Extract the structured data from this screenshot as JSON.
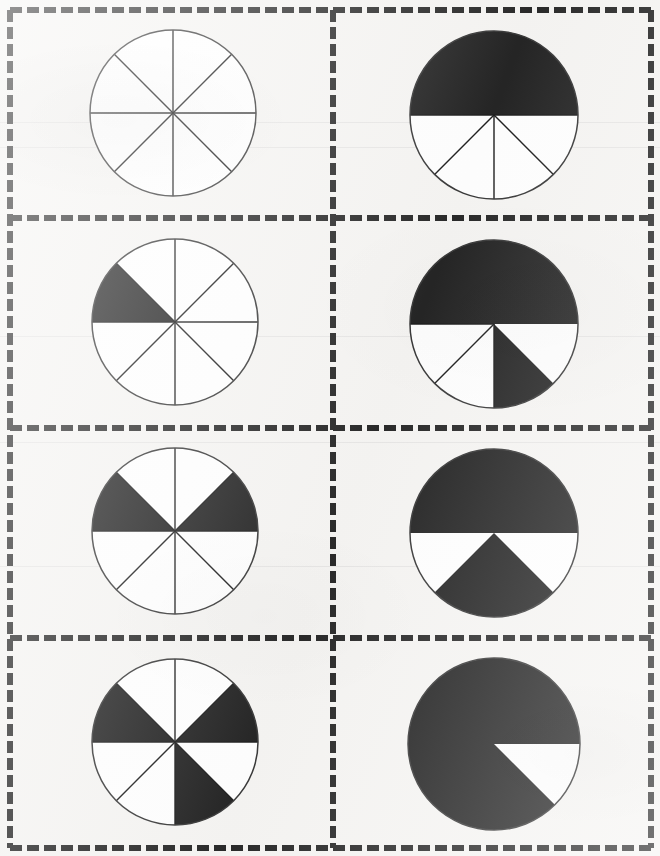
{
  "document": {
    "title": "Fraction Circles Worksheet",
    "description": "Worksheet page with eight circles each divided into eight equal sectors; a varying number of sectors is shaded black.",
    "page_background": "#f6f5f3",
    "ink_color": "#1f1f1f",
    "fill_color": "#252525",
    "border_color": "#2a2a2a",
    "outline_color": "#3a3a3a"
  },
  "grid": {
    "columns": 2,
    "rows": 4,
    "border_style": "dashed",
    "dash_length": 12,
    "dash_gap": 5,
    "border_thickness": 6,
    "outer": {
      "x": 10,
      "y": 10,
      "width": 641,
      "height": 838
    },
    "row_dividers_y": [
      218,
      428,
      638
    ],
    "column_divider_x": 333
  },
  "scanlines_y": [
    122,
    147,
    336,
    442,
    566
  ],
  "chart_data": [
    {
      "id": "circle-r1c1",
      "type": "pie",
      "title": "Circle 1",
      "row": 1,
      "column": 1,
      "total_sectors": 8,
      "filled_sectors": 0,
      "fraction": "0/8",
      "fraction_simplified": "0",
      "percent": 0,
      "filled_sector_indices": [],
      "visible_divider_indices": [
        0,
        1,
        2,
        3,
        4,
        5,
        6,
        7
      ],
      "categories": [
        "shaded",
        "unshaded"
      ],
      "values": [
        0,
        8
      ],
      "center": {
        "x": 173,
        "y": 113
      },
      "radius": 83
    },
    {
      "id": "circle-r1c2",
      "type": "pie",
      "title": "Circle 2",
      "row": 1,
      "column": 2,
      "total_sectors": 8,
      "filled_sectors": 4,
      "fraction": "4/8",
      "fraction_simplified": "1/2",
      "percent": 50,
      "filled_sector_indices": [
        0,
        1,
        2,
        3
      ],
      "visible_divider_indices": [
        4,
        5,
        6,
        7
      ],
      "categories": [
        "shaded",
        "unshaded"
      ],
      "values": [
        4,
        4
      ],
      "center": {
        "x": 494,
        "y": 115
      },
      "radius": 84
    },
    {
      "id": "circle-r2c1",
      "type": "pie",
      "title": "Circle 3",
      "row": 2,
      "column": 1,
      "total_sectors": 8,
      "filled_sectors": 1,
      "fraction": "1/8",
      "fraction_simplified": "1/8",
      "percent": 12.5,
      "filled_sector_indices": [
        3
      ],
      "visible_divider_indices": [
        0,
        1,
        2,
        3,
        4,
        5,
        6,
        7
      ],
      "categories": [
        "shaded",
        "unshaded"
      ],
      "values": [
        1,
        7
      ],
      "center": {
        "x": 175,
        "y": 322
      },
      "radius": 83
    },
    {
      "id": "circle-r2c2",
      "type": "pie",
      "title": "Circle 4",
      "row": 2,
      "column": 2,
      "total_sectors": 8,
      "filled_sectors": 5,
      "fraction": "5/8",
      "fraction_simplified": "5/8",
      "percent": 62.5,
      "filled_sector_indices": [
        0,
        1,
        2,
        3,
        6
      ],
      "visible_divider_indices": [
        4,
        5
      ],
      "categories": [
        "shaded",
        "unshaded"
      ],
      "values": [
        5,
        3
      ],
      "center": {
        "x": 494,
        "y": 324
      },
      "radius": 84
    },
    {
      "id": "circle-r3c1",
      "type": "pie",
      "title": "Circle 5",
      "row": 3,
      "column": 1,
      "total_sectors": 8,
      "filled_sectors": 2,
      "fraction": "2/8",
      "fraction_simplified": "1/4",
      "percent": 25,
      "filled_sector_indices": [
        0,
        3
      ],
      "visible_divider_indices": [
        0,
        1,
        2,
        3,
        4,
        5,
        6,
        7
      ],
      "categories": [
        "shaded",
        "unshaded"
      ],
      "values": [
        2,
        6
      ],
      "center": {
        "x": 175,
        "y": 531
      },
      "radius": 83
    },
    {
      "id": "circle-r3c2",
      "type": "pie",
      "title": "Circle 6",
      "row": 3,
      "column": 2,
      "total_sectors": 8,
      "filled_sectors": 6,
      "fraction": "6/8",
      "fraction_simplified": "3/4",
      "percent": 75,
      "filled_sector_indices": [
        0,
        1,
        2,
        3,
        5,
        6
      ],
      "visible_divider_indices": [],
      "categories": [
        "shaded",
        "unshaded"
      ],
      "values": [
        6,
        2
      ],
      "center": {
        "x": 494,
        "y": 533
      },
      "radius": 84
    },
    {
      "id": "circle-r4c1",
      "type": "pie",
      "title": "Circle 7",
      "row": 4,
      "column": 1,
      "total_sectors": 8,
      "filled_sectors": 3,
      "fraction": "3/8",
      "fraction_simplified": "3/8",
      "percent": 37.5,
      "filled_sector_indices": [
        0,
        3,
        6
      ],
      "visible_divider_indices": [
        0,
        1,
        2,
        3,
        4,
        5,
        6,
        7
      ],
      "categories": [
        "shaded",
        "unshaded"
      ],
      "values": [
        3,
        5
      ],
      "center": {
        "x": 175,
        "y": 742
      },
      "radius": 83
    },
    {
      "id": "circle-r4c2",
      "type": "pie",
      "title": "Circle 8",
      "row": 4,
      "column": 2,
      "total_sectors": 8,
      "filled_sectors": 7,
      "fraction": "7/8",
      "fraction_simplified": "7/8",
      "percent": 87.5,
      "filled_sector_indices": [
        0,
        1,
        2,
        3,
        4,
        5,
        6
      ],
      "visible_divider_indices": [],
      "categories": [
        "shaded",
        "unshaded"
      ],
      "values": [
        7,
        1
      ],
      "center": {
        "x": 494,
        "y": 744
      },
      "radius": 86
    }
  ]
}
